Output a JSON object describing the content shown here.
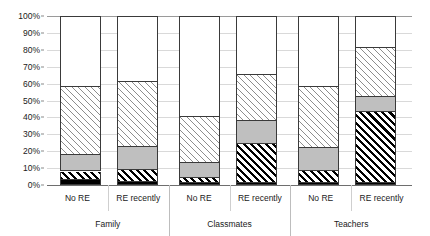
{
  "chart_data": {
    "type": "bar",
    "subtype": "100% stacked column",
    "title": "",
    "xlabel": "",
    "ylabel": "",
    "ylim": [
      0,
      100
    ],
    "y_unit": "%",
    "grid": true,
    "legend_position": "none",
    "y_ticks": [
      "0%",
      "10%",
      "20%",
      "30%",
      "40%",
      "50%",
      "60%",
      "70%",
      "80%",
      "90%",
      "100%"
    ],
    "y_tick_values": [
      0,
      10,
      20,
      30,
      40,
      50,
      60,
      70,
      80,
      90,
      100
    ],
    "groups": [
      {
        "label": "Family",
        "categories": [
          "No RE",
          "RE recently"
        ]
      },
      {
        "label": "Classmates",
        "categories": [
          "No RE",
          "RE recently"
        ]
      },
      {
        "label": "Teachers",
        "categories": [
          "No RE",
          "RE recently"
        ]
      }
    ],
    "categories": [
      "Family / No RE",
      "Family / RE recently",
      "Classmates / No RE",
      "Classmates / RE recently",
      "Teachers / No RE",
      "Teachers / RE recently"
    ],
    "series": [
      {
        "name": "series-1",
        "pattern": "solid-black",
        "color": "#000000",
        "values": [
          3,
          1.5,
          1,
          1,
          1,
          1
        ]
      },
      {
        "name": "series-2",
        "pattern": "hatch-dark",
        "color": "#000000",
        "values": [
          5,
          7.5,
          3,
          23,
          7,
          42
        ]
      },
      {
        "name": "series-3",
        "pattern": "solid-gray",
        "color": "#bfbfbf",
        "values": [
          10,
          13.5,
          9,
          14,
          14,
          9
        ]
      },
      {
        "name": "series-4",
        "pattern": "hatch-light",
        "color": "#8d8d8d",
        "values": [
          40,
          38.5,
          27,
          27,
          36,
          29
        ]
      },
      {
        "name": "series-5",
        "pattern": "solid-white",
        "color": "#ffffff",
        "values": [
          42,
          39,
          60,
          35,
          42,
          19
        ]
      }
    ],
    "cumulative_tops": [
      [
        3,
        8,
        18,
        58,
        100
      ],
      [
        1.5,
        9,
        22.5,
        61,
        100
      ],
      [
        1,
        4,
        13,
        40,
        100
      ],
      [
        1,
        24,
        38,
        65,
        100
      ],
      [
        1,
        8,
        22,
        58,
        100
      ],
      [
        1,
        43,
        52,
        81,
        100
      ]
    ]
  },
  "axis": {
    "y_labels": [
      "100%",
      "90%",
      "80%",
      "70%",
      "60%",
      "50%",
      "40%",
      "30%",
      "20%",
      "10%",
      "0%"
    ]
  },
  "x_axis": {
    "cells": [
      {
        "label": "No RE"
      },
      {
        "label": "RE recently"
      },
      {
        "label": "No RE"
      },
      {
        "label": "RE recently"
      },
      {
        "label": "No RE"
      },
      {
        "label": "RE recently"
      }
    ],
    "groups": [
      {
        "label": "Family"
      },
      {
        "label": "Classmates"
      },
      {
        "label": "Teachers"
      }
    ]
  }
}
